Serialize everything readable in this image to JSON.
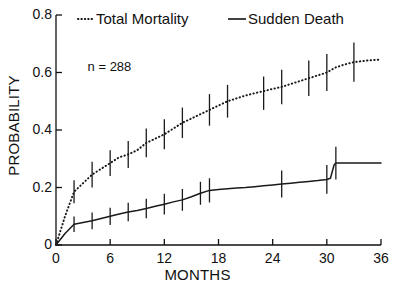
{
  "chart_data": {
    "type": "line",
    "title": "",
    "xlabel": "MONTHS",
    "ylabel": "PROBABILITY",
    "xlim": [
      0,
      36
    ],
    "ylim": [
      0,
      0.8
    ],
    "xticks": [
      "0",
      "6",
      "12",
      "18",
      "24",
      "30",
      "36"
    ],
    "yticks": [
      "0",
      "0.2",
      "0.4",
      "0.6",
      "0.8"
    ],
    "grid": false,
    "legend_position": "top",
    "annotations": [
      {
        "text": "n = 288",
        "x": 3.5,
        "y": 0.62
      }
    ],
    "series": [
      {
        "name": "Total Mortality",
        "style": "dotted",
        "color": "#1a1a1a",
        "x": [
          0,
          1,
          2,
          3,
          4,
          5,
          6,
          7,
          8,
          9,
          10,
          11,
          12,
          13,
          14,
          15,
          16,
          17,
          18,
          19,
          20,
          21,
          22,
          23,
          24,
          25,
          26,
          27,
          28,
          29,
          30,
          31,
          32,
          33,
          34,
          35,
          36
        ],
        "y": [
          0.0,
          0.1,
          0.185,
          0.215,
          0.245,
          0.265,
          0.285,
          0.305,
          0.315,
          0.33,
          0.355,
          0.37,
          0.385,
          0.405,
          0.425,
          0.44,
          0.455,
          0.47,
          0.485,
          0.5,
          0.51,
          0.52,
          0.528,
          0.535,
          0.543,
          0.55,
          0.56,
          0.57,
          0.58,
          0.59,
          0.6,
          0.618,
          0.628,
          0.636,
          0.64,
          0.643,
          0.645
        ],
        "error_bars": [
          {
            "x": 2,
            "y": 0.185,
            "lo": 0.145,
            "hi": 0.225
          },
          {
            "x": 4,
            "y": 0.245,
            "lo": 0.2,
            "hi": 0.29
          },
          {
            "x": 6,
            "y": 0.285,
            "lo": 0.24,
            "hi": 0.33
          },
          {
            "x": 8,
            "y": 0.315,
            "lo": 0.268,
            "hi": 0.362
          },
          {
            "x": 10,
            "y": 0.355,
            "lo": 0.305,
            "hi": 0.405
          },
          {
            "x": 12,
            "y": 0.385,
            "lo": 0.333,
            "hi": 0.437
          },
          {
            "x": 14,
            "y": 0.425,
            "lo": 0.372,
            "hi": 0.478
          },
          {
            "x": 17,
            "y": 0.47,
            "lo": 0.415,
            "hi": 0.525
          },
          {
            "x": 19,
            "y": 0.5,
            "lo": 0.443,
            "hi": 0.557
          },
          {
            "x": 23,
            "y": 0.528,
            "lo": 0.47,
            "hi": 0.586
          },
          {
            "x": 25,
            "y": 0.55,
            "lo": 0.49,
            "hi": 0.61
          },
          {
            "x": 28,
            "y": 0.58,
            "lo": 0.518,
            "hi": 0.642
          },
          {
            "x": 30,
            "y": 0.6,
            "lo": 0.536,
            "hi": 0.664
          },
          {
            "x": 33,
            "y": 0.636,
            "lo": 0.568,
            "hi": 0.704
          }
        ]
      },
      {
        "name": "Sudden Death",
        "style": "solid",
        "color": "#1a1a1a",
        "x": [
          0,
          1,
          2,
          3,
          4,
          5,
          6,
          7,
          8,
          9,
          10,
          11,
          12,
          13,
          14,
          15,
          16,
          17,
          18,
          19,
          20,
          21,
          22,
          23,
          24,
          25,
          26,
          27,
          28,
          29,
          30,
          30.4,
          30.8,
          31,
          32,
          33,
          34,
          35,
          36
        ],
        "y": [
          0.0,
          0.04,
          0.072,
          0.078,
          0.084,
          0.092,
          0.1,
          0.108,
          0.115,
          0.12,
          0.127,
          0.135,
          0.142,
          0.15,
          0.157,
          0.168,
          0.18,
          0.19,
          0.193,
          0.196,
          0.198,
          0.2,
          0.203,
          0.206,
          0.209,
          0.212,
          0.215,
          0.218,
          0.221,
          0.224,
          0.228,
          0.232,
          0.278,
          0.285,
          0.285,
          0.285,
          0.285,
          0.285,
          0.285
        ],
        "error_bars": [
          {
            "x": 2,
            "y": 0.072,
            "lo": 0.045,
            "hi": 0.099
          },
          {
            "x": 4,
            "y": 0.084,
            "lo": 0.055,
            "hi": 0.113
          },
          {
            "x": 6,
            "y": 0.1,
            "lo": 0.07,
            "hi": 0.13
          },
          {
            "x": 8,
            "y": 0.115,
            "lo": 0.083,
            "hi": 0.147
          },
          {
            "x": 10,
            "y": 0.127,
            "lo": 0.093,
            "hi": 0.161
          },
          {
            "x": 12,
            "y": 0.142,
            "lo": 0.106,
            "hi": 0.178
          },
          {
            "x": 14,
            "y": 0.157,
            "lo": 0.119,
            "hi": 0.195
          },
          {
            "x": 16,
            "y": 0.18,
            "lo": 0.14,
            "hi": 0.22
          },
          {
            "x": 17,
            "y": 0.19,
            "lo": 0.148,
            "hi": 0.232
          },
          {
            "x": 25,
            "y": 0.212,
            "lo": 0.165,
            "hi": 0.259
          },
          {
            "x": 30,
            "y": 0.228,
            "lo": 0.178,
            "hi": 0.278
          },
          {
            "x": 31,
            "y": 0.285,
            "lo": 0.228,
            "hi": 0.342
          }
        ]
      }
    ]
  },
  "legend": {
    "items": [
      {
        "label": "Total Mortality",
        "style": "dotted"
      },
      {
        "label": "Sudden Death",
        "style": "solid"
      }
    ]
  }
}
